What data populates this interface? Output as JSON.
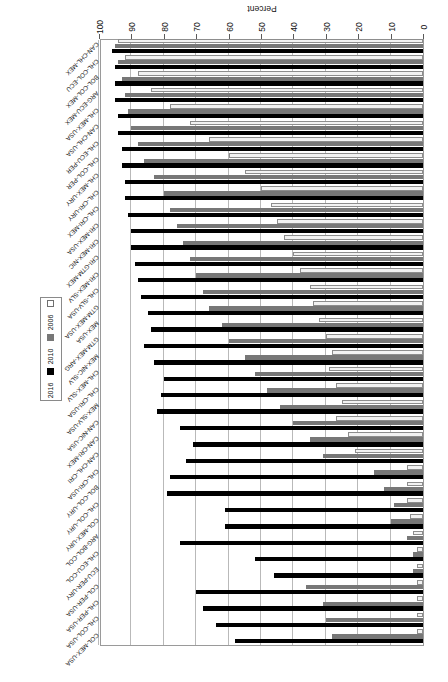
{
  "chart_data": {
    "type": "bar",
    "orientation": "horizontal",
    "title": "",
    "xlabel": "Percent",
    "ylabel": "",
    "xlim": [
      0,
      100
    ],
    "xticks": [
      0,
      10,
      20,
      30,
      40,
      50,
      60,
      70,
      80,
      90,
      100
    ],
    "grid": true,
    "legend_position": "right",
    "series": [
      {
        "name": "2016",
        "color": "#000000",
        "values": [
          95,
          95,
          94,
          94,
          92,
          92,
          91,
          90,
          90,
          90,
          90,
          89,
          88,
          87,
          86,
          85,
          84,
          83,
          82,
          80,
          79,
          78,
          76,
          75,
          74,
          72,
          70,
          68,
          64,
          58,
          70,
          72,
          71
        ]
      },
      {
        "name": "2010",
        "color": "#777777",
        "values": [
          94,
          93,
          92,
          92,
          90,
          89,
          88,
          86,
          85,
          84,
          83,
          80,
          78,
          76,
          74,
          72,
          70,
          68,
          65,
          62,
          60,
          57,
          54,
          50,
          46,
          42,
          38,
          33,
          27,
          20,
          12,
          9,
          6
        ]
      },
      {
        "name": "2006",
        "color": "#f2f2f2",
        "values": [
          93,
          92,
          91,
          91,
          88,
          87,
          86,
          84,
          83,
          81,
          80,
          76,
          72,
          70,
          66,
          63,
          60,
          57,
          52,
          48,
          44,
          40,
          36,
          30,
          25,
          20,
          16,
          12,
          8,
          5,
          3,
          2,
          1
        ]
      }
    ],
    "categories": [
      "CAN-CHL-MEX",
      "CHL-COL-ECU",
      "BOL-COL-MEX",
      "ARG-ECU-MEX",
      "CHL-MEX-USA",
      "CAN-CHL-USA",
      "CHL-ECU-PER",
      "CHL-COL-PER",
      "CHL-MEX-URY",
      "CHL-CRI-URY",
      "CHL-CRI-MEX",
      "CRI-MEX-USA",
      "CRI-MEX-NIC",
      "CRI-GTM-MEX",
      "CRI-MEX-SLV",
      "CHL-SLV-USA",
      "GTM-MEX-USA",
      "MEX-USA",
      "GTM-MEX-ARG",
      "MEX-NIC-SLV",
      "CHL-MEX-SLV",
      "CHL-CRI-USA",
      "MEX-SLV-USA",
      "CAN-NIC-USA",
      "CAN-CRI-MEX",
      "CAN-CHL-CRI",
      "CHL-CRI-USA",
      "BOL-COL-URY",
      "CHL-COL-URY",
      "COL-MEX-URY",
      "ARG-BOL-COL",
      "CHL-ECU-COL",
      "ECU-PER-URY"
    ],
    "categories_top_to_bottom": [
      "COL-MEX-USA",
      "CHL-COL-USA",
      "CHL-PER-USA",
      "COL-PER-USA",
      "ECU-PER-URY",
      "CHL-ECU-COL",
      "ARG-BOL-COL",
      "COL-MEX-URY",
      "CHL-COL-URY",
      "BOL-COL-URY",
      "CHL-CRI-USA",
      "CAN-CHL-CRI",
      "CAN-CRI-MEX",
      "CAN-NIC-USA",
      "MEX-SLV-USA",
      "CHL-CRI-USA",
      "CHL-MEX-SLV",
      "MEX-NIC-SLV",
      "GTM-MEX-ARG",
      "MEX-USA",
      "GTM-MEX-USA",
      "CHL-SLV-USA",
      "CRI-MEX-SLV",
      "CRI-GTM-MEX",
      "CRI-MEX-NIC",
      "CRI-MEX-USA",
      "CHL-CRI-MEX",
      "CHL-CRI-URY",
      "CHL-MEX-URY",
      "CHL-COL-PER",
      "CHL-ECU-PER",
      "CAN-CHL-USA",
      "CHL-MEX-USA",
      "ARG-ECU-MEX",
      "BOL-COL-MEX",
      "CHL-COL-ECU",
      "CAN-CHL-MEX"
    ],
    "rows": [
      {
        "label": "COL-MEX-USA",
        "y2016": 58,
        "y2010": 28,
        "y2006": 2
      },
      {
        "label": "CHL-COL-USA",
        "y2016": 64,
        "y2010": 30,
        "y2006": 2
      },
      {
        "label": "CHL-PER-USA",
        "y2016": 68,
        "y2010": 31,
        "y2006": 2
      },
      {
        "label": "COL-PER-USA",
        "y2016": 70,
        "y2010": 36,
        "y2006": 2
      },
      {
        "label": "ECU-PER-URY",
        "y2016": 46,
        "y2010": 3,
        "y2006": 2
      },
      {
        "label": "CHL-ECU-COL",
        "y2016": 52,
        "y2010": 3,
        "y2006": 2
      },
      {
        "label": "ARG-BOL-COL",
        "y2016": 75,
        "y2010": 5,
        "y2006": 3
      },
      {
        "label": "COL-MEX-URY",
        "y2016": 61,
        "y2010": 10,
        "y2006": 4
      },
      {
        "label": "CHL-COL-URY",
        "y2016": 61,
        "y2010": 9,
        "y2006": 5
      },
      {
        "label": "BOL-COL-URY",
        "y2016": 79,
        "y2010": 12,
        "y2006": 5
      },
      {
        "label": "CHL-CRI-USA",
        "y2016": 78,
        "y2010": 15,
        "y2006": 5
      },
      {
        "label": "CAN-CHL-CRI",
        "y2016": 73,
        "y2010": 31,
        "y2006": 21
      },
      {
        "label": "CAN-CRI-MEX",
        "y2016": 71,
        "y2010": 35,
        "y2006": 23
      },
      {
        "label": "CAN-NIC-USA",
        "y2016": 75,
        "y2010": 40,
        "y2006": 27
      },
      {
        "label": "MEX-SLV-USA",
        "y2016": 82,
        "y2010": 44,
        "y2006": 25
      },
      {
        "label": "CHL-CRI-USA",
        "y2016": 81,
        "y2010": 48,
        "y2006": 27
      },
      {
        "label": "CHL-MEX-SLV",
        "y2016": 80,
        "y2010": 52,
        "y2006": 29
      },
      {
        "label": "MEX-NIC-SLV",
        "y2016": 83,
        "y2010": 55,
        "y2006": 28
      },
      {
        "label": "GTM-MEX-ARG",
        "y2016": 86,
        "y2010": 60,
        "y2006": 30
      },
      {
        "label": "MEX-USA",
        "y2016": 84,
        "y2010": 62,
        "y2006": 32
      },
      {
        "label": "GTM-MEX-USA",
        "y2016": 85,
        "y2010": 66,
        "y2006": 34
      },
      {
        "label": "CHL-SLV-USA",
        "y2016": 87,
        "y2010": 68,
        "y2006": 35
      },
      {
        "label": "CRI-MEX-SLV",
        "y2016": 88,
        "y2010": 70,
        "y2006": 38
      },
      {
        "label": "CRI-GTM-MEX",
        "y2016": 89,
        "y2010": 72,
        "y2006": 40
      },
      {
        "label": "CRI-MEX-NIC",
        "y2016": 90,
        "y2010": 74,
        "y2006": 43
      },
      {
        "label": "CRI-MEX-USA",
        "y2016": 90,
        "y2010": 76,
        "y2006": 45
      },
      {
        "label": "CHL-CRI-MEX",
        "y2016": 91,
        "y2010": 78,
        "y2006": 47
      },
      {
        "label": "CHL-CRI-URY",
        "y2016": 92,
        "y2010": 80,
        "y2006": 50
      },
      {
        "label": "CHL-MEX-URY",
        "y2016": 92,
        "y2010": 83,
        "y2006": 55
      },
      {
        "label": "CHL-COL-PER",
        "y2016": 93,
        "y2010": 86,
        "y2006": 60
      },
      {
        "label": "CHL-ECU-PER",
        "y2016": 93,
        "y2010": 88,
        "y2006": 66
      },
      {
        "label": "CAN-CHL-USA",
        "y2016": 94,
        "y2010": 90,
        "y2006": 72
      },
      {
        "label": "CHL-MEX-USA",
        "y2016": 94,
        "y2010": 91,
        "y2006": 78
      },
      {
        "label": "ARG-ECU-MEX",
        "y2016": 95,
        "y2010": 92,
        "y2006": 84
      },
      {
        "label": "BOL-COL-MEX",
        "y2016": 95,
        "y2010": 93,
        "y2006": 88
      },
      {
        "label": "CHL-COL-ECU",
        "y2016": 95,
        "y2010": 94,
        "y2006": 92
      },
      {
        "label": "CAN-CHL-MEX",
        "y2016": 96,
        "y2010": 95,
        "y2006": 94
      }
    ]
  },
  "legend": {
    "items": [
      {
        "label": "2016",
        "color": "#000000"
      },
      {
        "label": "2010",
        "color": "#777777"
      },
      {
        "label": "2006",
        "color": "#ffffff"
      }
    ]
  },
  "axis": {
    "title": "Percent",
    "ticks": [
      "0",
      "10",
      "20",
      "30",
      "40",
      "50",
      "60",
      "70",
      "80",
      "90",
      "100"
    ]
  }
}
